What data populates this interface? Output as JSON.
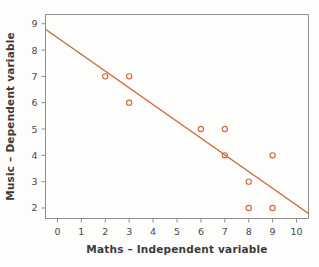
{
  "chart_data": {
    "type": "scatter",
    "title": "",
    "xlabel": "Maths – Independent variable",
    "ylabel": "Music – Dependent variable",
    "x": [
      2,
      3,
      3,
      6,
      7,
      7,
      8,
      8,
      9,
      9
    ],
    "y": [
      7,
      7,
      6,
      5,
      5,
      4,
      3,
      2,
      4,
      2
    ],
    "points": [
      {
        "x": 2,
        "y": 7
      },
      {
        "x": 3,
        "y": 7
      },
      {
        "x": 3,
        "y": 6
      },
      {
        "x": 6,
        "y": 5
      },
      {
        "x": 7,
        "y": 5
      },
      {
        "x": 7,
        "y": 4
      },
      {
        "x": 8,
        "y": 3
      },
      {
        "x": 8,
        "y": 2
      },
      {
        "x": 9,
        "y": 4
      },
      {
        "x": 9,
        "y": 2
      }
    ],
    "xlim": [
      -0.5,
      10.5
    ],
    "ylim": [
      1.6,
      9.35
    ],
    "xticks": [
      0,
      1,
      2,
      3,
      4,
      5,
      6,
      7,
      8,
      9,
      10
    ],
    "yticks": [
      2,
      3,
      4,
      5,
      6,
      7,
      8,
      9
    ],
    "xticklabels": [
      "0",
      "1",
      "2",
      "3",
      "4",
      "5",
      "6",
      "7",
      "8",
      "9",
      "10"
    ],
    "yticklabels": [
      "2",
      "3",
      "4",
      "5",
      "6",
      "7",
      "8",
      "9"
    ],
    "grid": false,
    "legend": false,
    "legend_position": "none",
    "trendline": {
      "name": "line of best fit",
      "x_start": -0.5,
      "y_start": 8.79,
      "x_end": 10.5,
      "y_end": 1.79,
      "slope": -0.636,
      "intercept": 8.47
    },
    "colors": {
      "marker_stroke": "#d2693c",
      "trendline": "#cf6b3b",
      "frame": "#8e8e90",
      "tick": "#8e8e90",
      "text": "#3b3b3b",
      "tick_text": "#4a4a4a",
      "background": "#fdfdfc"
    },
    "marker": {
      "shape": "open-circle",
      "radius": 2.6
    }
  }
}
